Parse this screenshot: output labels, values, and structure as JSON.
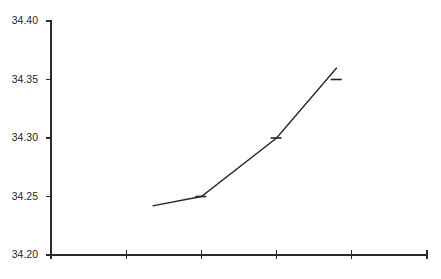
{
  "chart_data": {
    "type": "line",
    "title": "",
    "subtitle": "",
    "xlabel": "",
    "ylabel": "",
    "grid": false,
    "legend": null,
    "background_color": "#ffffff",
    "line_color": "#252525",
    "axis_color": "#2b2b2b",
    "text_color": "#1f1f1f",
    "ylim": [
      34.2,
      34.4
    ],
    "yticks": [
      34.2,
      34.25,
      34.3,
      34.35,
      34.4
    ],
    "ytick_labels": [
      "34.20",
      "34.25",
      "34.30",
      "34.35",
      "34.40"
    ],
    "xlim": [
      0,
      5
    ],
    "xticks": [
      0,
      1,
      2,
      3,
      4,
      5
    ],
    "xtick_labels": [
      "",
      "",
      "",
      "",
      "",
      ""
    ],
    "series": [
      {
        "name": "series-1",
        "x": [
          1.35,
          2.0,
          3.0,
          3.8
        ],
        "values": [
          34.242,
          34.25,
          34.3,
          34.36
        ],
        "marker": "horizontal-dash",
        "marker_points": [
          {
            "x": 2.0,
            "y": 34.25
          },
          {
            "x": 3.0,
            "y": 34.3
          },
          {
            "x": 3.8,
            "y": 34.35
          }
        ]
      }
    ],
    "annotations": []
  },
  "axes": {
    "y_axis_name": "y-axis",
    "x_axis_name": "x-axis"
  }
}
